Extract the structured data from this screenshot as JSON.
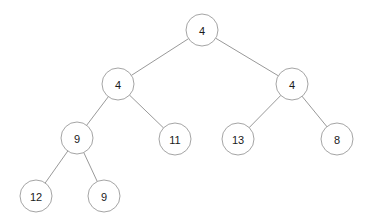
{
  "figure": {
    "kind": "binary-tree-diagram",
    "title": "",
    "width": 365,
    "height": 224,
    "background_color": "#ffffff",
    "node_fill_color": "#ffffff",
    "node_stroke_color": "#9a9a9a",
    "edge_color": "#8d8d8d",
    "label_color": "#1a1a1a",
    "node_radius": 16
  },
  "tree": {
    "nodes": [
      {
        "id": "root",
        "label": "4",
        "x": 202,
        "y": 30,
        "depth": 0
      },
      {
        "id": "n-l",
        "label": "4",
        "x": 118,
        "y": 84,
        "depth": 1
      },
      {
        "id": "n-r",
        "label": "4",
        "x": 292,
        "y": 84,
        "depth": 1
      },
      {
        "id": "n-ll",
        "label": "9",
        "x": 77,
        "y": 138,
        "depth": 2
      },
      {
        "id": "n-lr",
        "label": "11",
        "x": 175,
        "y": 139,
        "depth": 2
      },
      {
        "id": "n-rl",
        "label": "13",
        "x": 238,
        "y": 139,
        "depth": 2
      },
      {
        "id": "n-rr",
        "label": "8",
        "x": 337,
        "y": 139,
        "depth": 2
      },
      {
        "id": "n-lll",
        "label": "12",
        "x": 36,
        "y": 196,
        "depth": 3
      },
      {
        "id": "n-llr",
        "label": "9",
        "x": 104,
        "y": 196,
        "depth": 3
      }
    ],
    "edges": [
      {
        "id": "e-root-l",
        "from": "root",
        "to": "n-l",
        "side": "left"
      },
      {
        "id": "e-root-r",
        "from": "root",
        "to": "n-r",
        "side": "right"
      },
      {
        "id": "e-l-ll",
        "from": "n-l",
        "to": "n-ll",
        "side": "left"
      },
      {
        "id": "e-l-lr",
        "from": "n-l",
        "to": "n-lr",
        "side": "right"
      },
      {
        "id": "e-r-rl",
        "from": "n-r",
        "to": "n-rl",
        "side": "left"
      },
      {
        "id": "e-r-rr",
        "from": "n-r",
        "to": "n-rr",
        "side": "right"
      },
      {
        "id": "e-ll-lll",
        "from": "n-ll",
        "to": "n-lll",
        "side": "left"
      },
      {
        "id": "e-ll-llr",
        "from": "n-ll",
        "to": "n-llr",
        "side": "right"
      }
    ]
  }
}
